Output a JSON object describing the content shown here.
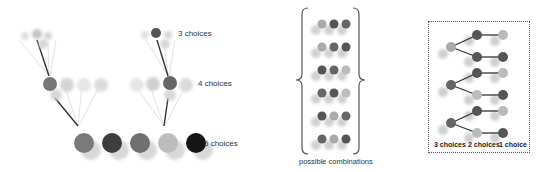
{
  "tree": {
    "labels": {
      "level3": "3 choices",
      "level2": "4 choices",
      "level1": "5 choices"
    }
  },
  "combinations": {
    "caption": "possible combinations",
    "rows": 6
  },
  "decision_box": {
    "labels": [
      "3 choices",
      "2 choices",
      "1 choice"
    ]
  }
}
